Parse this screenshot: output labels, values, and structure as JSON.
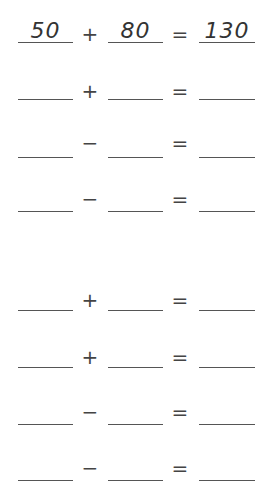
{
  "worksheet": {
    "equations": [
      {
        "a": "50",
        "op": "+",
        "b": "80",
        "eq": "=",
        "c": "130"
      },
      {
        "a": "",
        "op": "+",
        "b": "",
        "eq": "=",
        "c": ""
      },
      {
        "a": "",
        "op": "−",
        "b": "",
        "eq": "=",
        "c": ""
      },
      {
        "a": "",
        "op": "−",
        "b": "",
        "eq": "=",
        "c": ""
      },
      {
        "a": "",
        "op": "+",
        "b": "",
        "eq": "=",
        "c": ""
      },
      {
        "a": "",
        "op": "+",
        "b": "",
        "eq": "=",
        "c": ""
      },
      {
        "a": "",
        "op": "−",
        "b": "",
        "eq": "=",
        "c": ""
      },
      {
        "a": "",
        "op": "−",
        "b": "",
        "eq": "=",
        "c": ""
      }
    ]
  }
}
